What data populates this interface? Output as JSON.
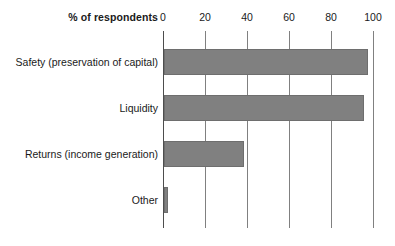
{
  "chart_data": {
    "type": "bar",
    "orientation": "horizontal",
    "title": "",
    "xlabel": "% of respondents",
    "ylabel": "",
    "xlim": [
      0,
      100
    ],
    "xticks": [
      0,
      20,
      40,
      60,
      80,
      100
    ],
    "xtick_labels": [
      "0",
      "20",
      "40",
      "60",
      "80",
      "100"
    ],
    "grid": true,
    "legend": false,
    "bar_color": "#808080",
    "categories": [
      "Safety (preservation of capital)",
      "Liquidity",
      "Returns (income generation)",
      "Other"
    ],
    "values": [
      97,
      95,
      38,
      2
    ]
  }
}
